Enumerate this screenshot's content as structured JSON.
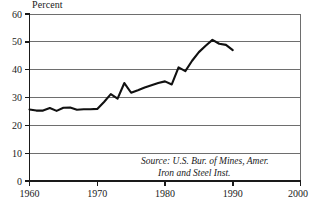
{
  "chart_data": {
    "type": "line",
    "title": "Percent",
    "xlabel": "",
    "ylabel": "",
    "xlim": [
      1960,
      2000
    ],
    "ylim": [
      0,
      60
    ],
    "grid": true,
    "legend": "none",
    "x_ticks": [
      1960,
      1970,
      1980,
      1990,
      2000
    ],
    "y_ticks": [
      0,
      10,
      20,
      30,
      40,
      50,
      60
    ],
    "annotations": [
      "Source: U.S. Bur. of Mines, Amer.",
      "Iron and Steel Inst."
    ],
    "series": [
      {
        "name": "Percent",
        "x": [
          1960,
          1961,
          1962,
          1963,
          1964,
          1965,
          1966,
          1967,
          1968,
          1969,
          1970,
          1971,
          1972,
          1973,
          1974,
          1975,
          1976,
          1977,
          1978,
          1979,
          1980,
          1981,
          1982,
          1983,
          1984,
          1985,
          1986,
          1987,
          1988,
          1989,
          1990
        ],
        "values": [
          25.7,
          25.3,
          25.3,
          26.2,
          25.2,
          26.3,
          26.4,
          25.6,
          25.8,
          25.8,
          25.9,
          28.4,
          31.2,
          29.6,
          35.2,
          31.7,
          32.6,
          33.6,
          34.4,
          35.2,
          35.8,
          34.7,
          40.8,
          39.5,
          43.2,
          46.3,
          48.6,
          50.7,
          49.3,
          48.9,
          47.0
        ]
      }
    ]
  },
  "axis": {
    "y_labels": [
      "60",
      "50",
      "40",
      "30",
      "20",
      "10",
      "0"
    ],
    "x_labels": [
      "1960",
      "1970",
      "1980",
      "1990",
      "2000"
    ]
  },
  "source": {
    "line1": "Source: U.S. Bur. of Mines, Amer.",
    "line2": "Iron and Steel Inst."
  },
  "colors": {
    "line": "#111111",
    "grid": "#6e6e6e",
    "axis": "#1a1a1a",
    "background": "#ffffff"
  }
}
